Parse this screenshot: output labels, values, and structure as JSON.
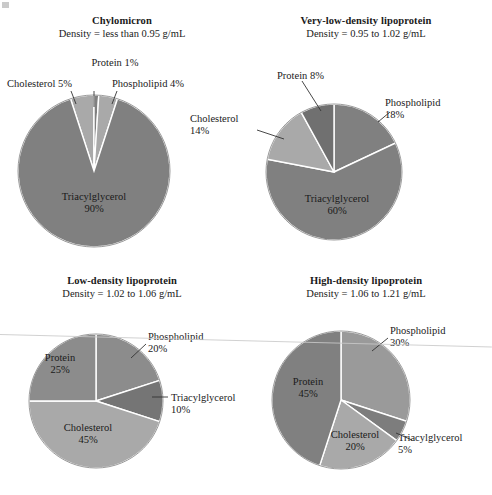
{
  "figure": {
    "background": "#ffffff",
    "text_color": "#1a1a1a",
    "slice_colors": {
      "dark_gray": "#808080",
      "light_gray": "#a9a9a9",
      "divider": "#ffffff"
    },
    "artifacts": {
      "corner_speck": "scan-speck",
      "scan_line_label": "scanner-streak"
    }
  },
  "chart_data": [
    {
      "type": "pie",
      "id": "chylomicron",
      "title": "Chylomicron",
      "subtitle": "Density = less than 0.95 g/mL",
      "categories": [
        "Cholesterol",
        "Protein",
        "Phospholipid",
        "Triacylglycerol"
      ],
      "values": [
        5,
        1,
        4,
        90
      ],
      "labels": [
        "Cholesterol 5%",
        "Protein 1%",
        "Phospholipid 4%",
        "Triacylglycerol 90%"
      ],
      "colors": [
        "#a9a9a9",
        "#808080",
        "#a9a9a9",
        "#808080"
      ],
      "legend_position": "callouts",
      "center": [
        94,
        171
      ],
      "radius": 76,
      "start_angle": -18
    },
    {
      "type": "pie",
      "id": "vldl",
      "title": "Very-low-density lipoprotein",
      "subtitle": "Density =  0.95 to 1.02 g/mL",
      "categories": [
        "Phospholipid",
        "Triacylglycerol",
        "Cholesterol",
        "Protein"
      ],
      "values": [
        18,
        60,
        14,
        8
      ],
      "labels": [
        "Phospholipid 18%",
        "Triacylglycerol 60%",
        "Cholesterol 14%",
        "Protein 8%"
      ],
      "colors": [
        "#808080",
        "#808080",
        "#a9a9a9",
        "#707070"
      ],
      "legend_position": "callouts",
      "center": [
        334,
        172
      ],
      "radius": 68,
      "start_angle": 0
    },
    {
      "type": "pie",
      "id": "ldl",
      "title": "Low-density lipoprotein",
      "subtitle": "Density = 1.02 to 1.06 g/mL",
      "categories": [
        "Phospholipid",
        "Triacylglycerol",
        "Cholesterol",
        "Protein"
      ],
      "values": [
        20,
        10,
        45,
        25
      ],
      "labels": [
        "Phospholipid 20%",
        "Triacylglycerol 10%",
        "Cholesterol 45%",
        "Protein 25%"
      ],
      "colors": [
        "#8c8c8c",
        "#757575",
        "#a9a9a9",
        "#8c8c8c"
      ],
      "legend_position": "callouts",
      "center": [
        96,
        401
      ],
      "radius": 67,
      "start_angle": 0
    },
    {
      "type": "pie",
      "id": "hdl",
      "title": "High-density lipoprotein",
      "subtitle": "Density =  1.06 to 1.21 g/mL",
      "categories": [
        "Phospholipid",
        "Triacylglycerol",
        "Cholesterol",
        "Protein"
      ],
      "values": [
        30,
        5,
        20,
        45
      ],
      "labels": [
        "Phospholipid 30%",
        "Triacylglycerol 5%",
        "Cholesterol 20%",
        "Protein 45%"
      ],
      "colors": [
        "#9a9a9a",
        "#7d7d7d",
        "#a9a9a9",
        "#808080"
      ],
      "legend_position": "callouts",
      "center": [
        341,
        400
      ],
      "radius": 69,
      "start_angle": 0
    }
  ],
  "panels": {
    "chylomicron": {
      "title": "Chylomicron",
      "density": "Density = less than 0.95 g/mL",
      "callouts": {
        "protein": "Protein 1%",
        "cholesterol": "Cholesterol 5%",
        "phospholipid": "Phospholipid 4%"
      },
      "inner": {
        "triacylglycerol_name": "Triacylglycerol",
        "triacylglycerol_pct": "90%"
      }
    },
    "vldl": {
      "title": "Very-low-density lipoprotein",
      "density": "Density =  0.95 to 1.02 g/mL",
      "callouts": {
        "protein": "Protein 8%",
        "phospholipid_name": "Phospholipid",
        "phospholipid_pct": "18%",
        "cholesterol_name": "Cholesterol",
        "cholesterol_pct": "14%"
      },
      "inner": {
        "triacylglycerol_name": "Triacylglycerol",
        "triacylglycerol_pct": "60%"
      }
    },
    "ldl": {
      "title": "Low-density lipoprotein",
      "density": "Density = 1.02 to 1.06 g/mL",
      "callouts": {
        "phospholipid_name": "Phospholipid",
        "phospholipid_pct": "20%",
        "triacylglycerol_name": "Triacylglycerol",
        "triacylglycerol_pct": "10%"
      },
      "inner": {
        "protein_name": "Protein",
        "protein_pct": "25%",
        "cholesterol_name": "Cholesterol",
        "cholesterol_pct": "45%"
      }
    },
    "hdl": {
      "title": "High-density lipoprotein",
      "density": "Density =  1.06 to 1.21 g/mL",
      "callouts": {
        "phospholipid_name": "Phospholipid",
        "phospholipid_pct": "30%",
        "triacylglycerol_name": "Triacylglycerol",
        "triacylglycerol_pct": "5%"
      },
      "inner": {
        "protein_name": "Protein",
        "protein_pct": "45%",
        "cholesterol_name": "Cholesterol",
        "cholesterol_pct": "20%"
      }
    }
  }
}
